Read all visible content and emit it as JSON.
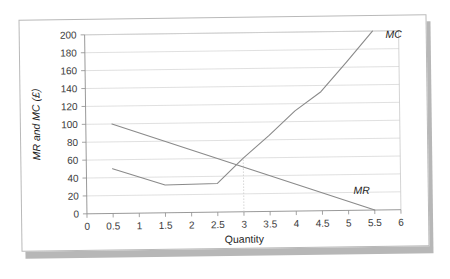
{
  "figure": {
    "name": "mr-mc-marginal-analysis-chart",
    "background_color": "#ffffff",
    "frame_color": "#b9b9b9",
    "shadow_color": "#b7b7b7"
  },
  "chart_data": {
    "type": "line",
    "title": "",
    "xlabel": "Quantity",
    "ylabel": "MR and MC (£)",
    "xlim": [
      0,
      6
    ],
    "ylim": [
      0,
      200
    ],
    "xticks": [
      0,
      0.5,
      1,
      1.5,
      2,
      2.5,
      3,
      3.5,
      4,
      4.5,
      5,
      5.5,
      6
    ],
    "xtick_labels": [
      "0",
      "0.5",
      "1",
      "1.5",
      "2",
      "2.5",
      "3",
      "3.5",
      "4",
      "4.5",
      "5",
      "5.5",
      "6"
    ],
    "yticks": [
      0,
      20,
      40,
      60,
      80,
      100,
      120,
      140,
      160,
      180,
      200
    ],
    "ytick_labels": [
      "0",
      "20",
      "40",
      "60",
      "80",
      "100",
      "120",
      "140",
      "160",
      "180",
      "200"
    ],
    "grid": "horizontal",
    "legend_position": "inline-end-of-line",
    "line_color": "#8a8a8a",
    "series": [
      {
        "name": "MC",
        "label": "MC",
        "label_x": 5.75,
        "label_y": 196,
        "x": [
          0.5,
          1.5,
          2.5,
          3.0,
          3.5,
          4.0,
          4.5,
          5.0,
          5.5
        ],
        "y": [
          50,
          31,
          32,
          60,
          85,
          112,
          133,
          166,
          200
        ]
      },
      {
        "name": "MR",
        "label": "MR",
        "label_x": 5.1,
        "label_y": 22,
        "x": [
          0.5,
          5.5
        ],
        "y": [
          100,
          0
        ]
      }
    ],
    "annotations": [
      {
        "name": "equilibrium-drop-line",
        "type": "vertical-dotted-line",
        "x": 3.0,
        "y_from": 0,
        "y_to": 60,
        "color": "#c6c6c6"
      }
    ]
  }
}
